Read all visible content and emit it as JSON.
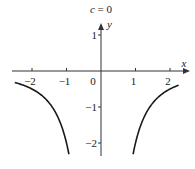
{
  "chart_data": {
    "type": "line",
    "title": "c = 0",
    "xlabel": "x",
    "ylabel": "y",
    "xlim": [
      -2.5,
      2.4
    ],
    "ylim": [
      -2.4,
      1.6
    ],
    "xticks": [
      -2,
      -1,
      0,
      1,
      2
    ],
    "xtick_labels": [
      "−2",
      "−1",
      "0",
      "1",
      "2"
    ],
    "yticks": [
      1,
      -1,
      -2
    ],
    "ytick_labels": [
      "1",
      "−1",
      "−2"
    ],
    "grid": false,
    "legend": null,
    "function": "y = -2/x^2",
    "series": [
      {
        "name": "left branch",
        "x": [
          -2.5,
          -2.0,
          -1.5,
          -1.2,
          -1.0,
          -0.93
        ],
        "y": [
          -0.32,
          -0.5,
          -0.89,
          -1.39,
          -2.0,
          -2.3
        ]
      },
      {
        "name": "right branch",
        "x": [
          0.93,
          1.0,
          1.2,
          1.5,
          2.0,
          2.25
        ],
        "y": [
          -2.3,
          -2.0,
          -1.39,
          -0.89,
          -0.5,
          -0.4
        ]
      }
    ]
  },
  "labels": {
    "title": "c = 0",
    "x_axis": "x",
    "y_axis": "y",
    "origin": "0"
  },
  "colors": {
    "curve": "#1a1a1a",
    "axis": "#333333"
  }
}
